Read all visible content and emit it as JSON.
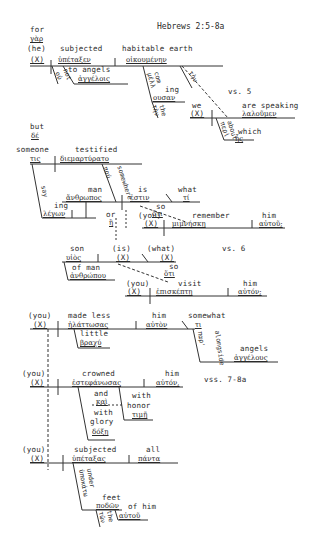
{
  "title": "Hebrews 2:5-8a",
  "verse_labels": {
    "vs5": "vs. 5",
    "vs6": "vs. 6",
    "vss7_8a": "vss. 7-8a"
  },
  "clause1": {
    "conj_en": "for",
    "conj_gr": "γὰρ",
    "subject": "(he)",
    "subject_x": "(X)",
    "verb_en": "subjected",
    "verb_gr": "ὑπέταξεν",
    "object_en": "habitable earth",
    "object_gr": "οἰκουμένην",
    "neg_en": "not",
    "neg_gr": "οὐ",
    "io_en": "to angels",
    "io_gr": "ἀγγέλοις",
    "art_gr": "τὴν",
    "ptc_en1": "com",
    "ptc_en2": "ing",
    "ptc_gr1": "μέλλ",
    "ptc_gr2": "ουσαν",
    "art2_en": "the",
    "art2_gr": "τὴν"
  },
  "clause2": {
    "subject_en": "we",
    "subject_x": "(X)",
    "verb_en": "are speaking",
    "verb_gr": "λαλοῦμεν",
    "prep_en": "about",
    "prep_gr": "περὶ",
    "rel_en": "which",
    "rel_gr": "ἧς"
  },
  "clause3": {
    "conj_en": "but",
    "conj_gr": "δέ",
    "subject_en": "someone",
    "subject_gr": "τις",
    "verb_en": "testified",
    "verb_gr": "διεμαρτύρατο",
    "adv_en": "somewhere",
    "adv_gr": "πού",
    "ptc_en1": "say",
    "ptc_en2": "ing",
    "ptc_gr": "λέγων"
  },
  "clause4": {
    "subject_en": "man",
    "subject_gr": "ἄνθρωπος",
    "verb_en": "is",
    "verb_gr": "ἐστιν",
    "pred_en": "what",
    "pred_gr": "τί",
    "conj_en": "so",
    "conj_gr": "ὅτι",
    "or_en": "or",
    "or_gr": "ἢ"
  },
  "clause5": {
    "subject": "(you)",
    "subject_x": "(X)",
    "verb_en": "remember",
    "verb_gr": "μιμνήσκῃ",
    "object_en": "him",
    "object_gr": "αὐτοῦ;"
  },
  "clause6": {
    "subject_en": "son",
    "subject_gr": "υἱὸς",
    "verb_en": "(is)",
    "verb_x": "(X)",
    "pred_en": "(what)",
    "pred_x": "(X)",
    "mod_en": "of man",
    "mod_gr": "ἀνθρώπου",
    "conj_en": "so",
    "conj_gr": "ὅτι"
  },
  "clause7": {
    "subject": "(you)",
    "subject_x": "(X)",
    "verb_en": "visit",
    "verb_gr": "ἐπισκέπτῃ",
    "object_en": "him",
    "object_gr": "αὐτόν;"
  },
  "clause8": {
    "subject": "(you)",
    "subject_x": "(X)",
    "verb_en": "made less",
    "verb_gr": "ἠλάττωσας",
    "object_en": "him",
    "object_gr": "αὐτὸν",
    "adv_en": "somewhat",
    "adv_gr": "τι",
    "mod_en": "little",
    "mod_gr": "βραχύ",
    "prep_en": "alongside",
    "prep_gr": "παρ'",
    "pobj_en": "angels",
    "pobj_gr": "ἀγγέλους"
  },
  "clause9": {
    "subject": "(you)",
    "subject_x": "(X)",
    "verb_en": "crowned",
    "verb_gr": "ἐστεφάνωσας",
    "object_en": "him",
    "object_gr": "αὐτόν,",
    "conj_en": "and",
    "conj_gr": "καὶ",
    "glory_en1": "with",
    "glory_en2": "glory",
    "glory_gr": "δόξῃ",
    "honor_en1": "with",
    "honor_en2": "honor",
    "honor_gr": "τιμῇ"
  },
  "clause10": {
    "subject": "(you)",
    "subject_x": "(X)",
    "verb_en": "subjected",
    "verb_gr": "ὑπέταξας",
    "object_en": "all",
    "object_gr": "πάντα",
    "prep_en": "under",
    "prep_gr": "ὑποκάτω",
    "pobj_en": "feet",
    "pobj_gr": "ποδῶν",
    "art_en": "the",
    "art_gr": "τῶν",
    "poss_en": "of him",
    "poss_gr": "αὐτοῦ"
  }
}
